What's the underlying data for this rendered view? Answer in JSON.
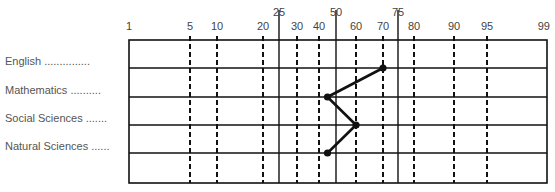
{
  "chart_data": {
    "type": "line",
    "title": "",
    "xlabel": "Percentile",
    "ylabel": "",
    "orientation": "horizontal-profile",
    "x_scale": "percentile (normal probability)",
    "xlim": [
      1,
      99
    ],
    "ticks_lower": [
      1,
      5,
      10,
      20,
      30,
      40,
      60,
      70,
      80,
      90,
      95,
      99
    ],
    "ticks_upper": [
      25,
      50,
      75
    ],
    "dashed_gridlines": [
      5,
      10,
      20,
      30,
      40,
      60,
      70,
      80,
      90,
      95
    ],
    "solid_gridlines": [
      25,
      50,
      75
    ],
    "categories": [
      "English",
      "Mathematics",
      "Social Sciences",
      "Natural Sciences"
    ],
    "series": [
      {
        "name": "Percentile rank",
        "values": [
          70,
          45,
          60,
          45
        ]
      }
    ],
    "grid": true,
    "legend": "none"
  },
  "labels": {
    "rows": [
      {
        "text": "English",
        "leader": "..............."
      },
      {
        "text": "Mathematics",
        "leader": ".........."
      },
      {
        "text": "Social Sciences",
        "leader": "......."
      },
      {
        "text": "Natural Sciences",
        "leader": "......"
      }
    ]
  },
  "colors": {
    "line": "#111111",
    "grid": "#111111",
    "text": "#444444"
  }
}
